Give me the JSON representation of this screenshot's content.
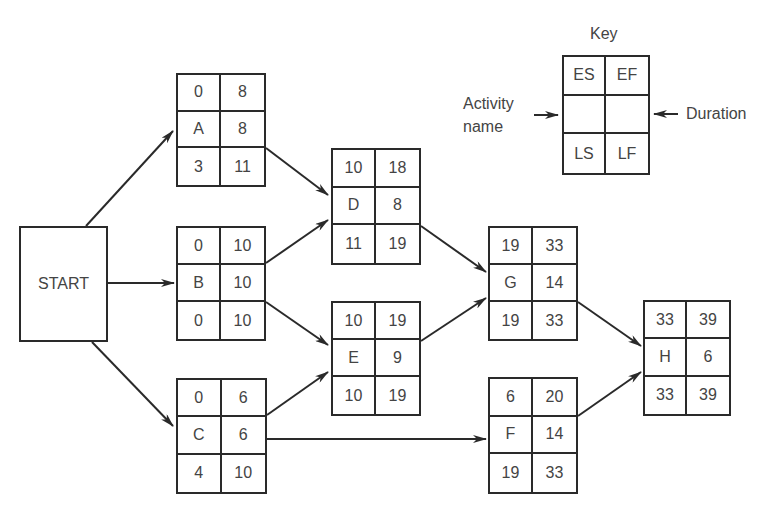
{
  "title": "",
  "key": {
    "title": "Key",
    "cells": [
      "ES",
      "EF",
      "",
      "",
      "LS",
      "LF"
    ],
    "left_label_line1": "Activity",
    "left_label_line2": "name",
    "right_label": "Duration"
  },
  "start": {
    "label": "START"
  },
  "nodes": {
    "A": {
      "es": "0",
      "ef": "8",
      "name": "A",
      "dur": "8",
      "ls": "3",
      "lf": "11"
    },
    "B": {
      "es": "0",
      "ef": "10",
      "name": "B",
      "dur": "10",
      "ls": "0",
      "lf": "10"
    },
    "C": {
      "es": "0",
      "ef": "6",
      "name": "C",
      "dur": "6",
      "ls": "4",
      "lf": "10"
    },
    "D": {
      "es": "10",
      "ef": "18",
      "name": "D",
      "dur": "8",
      "ls": "11",
      "lf": "19"
    },
    "E": {
      "es": "10",
      "ef": "19",
      "name": "E",
      "dur": "9",
      "ls": "10",
      "lf": "19"
    },
    "F": {
      "es": "6",
      "ef": "20",
      "name": "F",
      "dur": "14",
      "ls": "19",
      "lf": "33"
    },
    "G": {
      "es": "19",
      "ef": "33",
      "name": "G",
      "dur": "14",
      "ls": "19",
      "lf": "33"
    },
    "H": {
      "es": "33",
      "ef": "39",
      "name": "H",
      "dur": "6",
      "ls": "33",
      "lf": "39"
    }
  },
  "edges": [
    [
      "START",
      "A"
    ],
    [
      "START",
      "B"
    ],
    [
      "START",
      "C"
    ],
    [
      "A",
      "D"
    ],
    [
      "B",
      "D"
    ],
    [
      "B",
      "E"
    ],
    [
      "C",
      "E"
    ],
    [
      "C",
      "F"
    ],
    [
      "D",
      "G"
    ],
    [
      "E",
      "G"
    ],
    [
      "G",
      "H"
    ],
    [
      "F",
      "H"
    ]
  ],
  "colors": {
    "line": "#2a2a2a",
    "text": "#444444",
    "background": "#ffffff"
  }
}
